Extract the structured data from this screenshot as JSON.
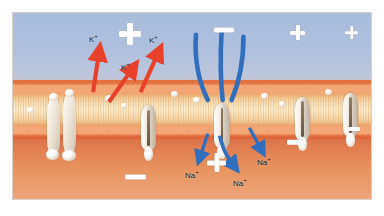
{
  "figure": {
    "regions": {
      "extracellular_label": "extracellular fluid",
      "membrane_label": "phospholipid bilayer",
      "cytoplasm_label": "cytoplasm"
    },
    "colors": {
      "extracellular": "#aec0de",
      "cytoplasm": "#e8935f",
      "bilayer_head": "#e2703f",
      "bilayer_tail": "#f6dcb4",
      "potassium_arrow": "#e8402a",
      "sodium_arrow": "#2f6fbe",
      "symbol": "#ffffff",
      "protein": "#f3ece2"
    }
  },
  "ions": {
    "potassium": [
      {
        "label": "K",
        "charge": "+",
        "x": 88,
        "y": 36
      },
      {
        "label": "K",
        "charge": "+",
        "x": 120,
        "y": 64
      },
      {
        "label": "K",
        "charge": "+",
        "x": 148,
        "y": 37
      }
    ],
    "sodium": [
      {
        "label": "Na",
        "charge": "+",
        "x": 188,
        "y": 168
      },
      {
        "label": "Na",
        "charge": "+",
        "x": 236,
        "y": 176
      },
      {
        "label": "Na",
        "charge": "+",
        "x": 256,
        "y": 155
      }
    ]
  },
  "charges": {
    "outside": [
      {
        "type": "plus",
        "x": 118,
        "y": 22,
        "size": 22
      },
      {
        "type": "minus",
        "x": 213,
        "y": 26,
        "size": 20
      },
      {
        "type": "plus",
        "x": 289,
        "y": 24,
        "size": 15
      },
      {
        "type": "plus",
        "x": 344,
        "y": 25,
        "size": 14
      }
    ],
    "inside": [
      {
        "type": "minus",
        "x": 124,
        "y": 173,
        "size": 21
      },
      {
        "type": "plus",
        "x": 206,
        "y": 152,
        "size": 19
      },
      {
        "type": "minus",
        "x": 286,
        "y": 139,
        "size": 18
      },
      {
        "type": "minus",
        "x": 343,
        "y": 126,
        "size": 16
      }
    ]
  },
  "arrows": {
    "potassium_outward": [
      {
        "x1": 92,
        "y1": 90,
        "x2": 98,
        "y2": 48
      },
      {
        "x1": 108,
        "y1": 98,
        "x2": 132,
        "y2": 66
      },
      {
        "x1": 140,
        "y1": 90,
        "x2": 158,
        "y2": 48
      }
    ],
    "sodium_inward": [
      {
        "x1": 196,
        "y1": 34,
        "x2": 205,
        "y2": 100
      },
      {
        "x1": 222,
        "y1": 30,
        "x2": 222,
        "y2": 100
      },
      {
        "x1": 244,
        "y1": 36,
        "x2": 232,
        "y2": 102
      },
      {
        "x1": 210,
        "y1": 140,
        "x2": 200,
        "y2": 162
      },
      {
        "x1": 224,
        "y1": 140,
        "x2": 238,
        "y2": 168
      },
      {
        "x1": 252,
        "y1": 132,
        "x2": 262,
        "y2": 152
      }
    ]
  },
  "proteins": [
    {
      "name": "carrier-protein-complex",
      "x": 46,
      "y": 96,
      "w": 13,
      "h": 56
    },
    {
      "name": "carrier-protein-complex",
      "x": 62,
      "y": 92,
      "w": 13,
      "h": 60
    },
    {
      "name": "ion-channel",
      "x": 140,
      "y": 102,
      "w": 15,
      "h": 48
    },
    {
      "name": "ion-channel",
      "x": 213,
      "y": 100,
      "w": 16,
      "h": 48
    },
    {
      "name": "ion-channel",
      "x": 294,
      "y": 96,
      "w": 15,
      "h": 46
    },
    {
      "name": "ion-channel",
      "x": 342,
      "y": 92,
      "w": 15,
      "h": 46
    }
  ]
}
